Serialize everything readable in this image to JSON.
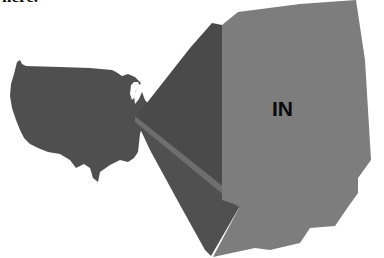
{
  "caption": {
    "text": "here."
  },
  "diagram": {
    "source_shape": "contiguous-usa-map",
    "target_shape": "indiana-outline",
    "target_label": "IN",
    "colors": {
      "background": "#ffffff",
      "usa_map": "#4f4f4f",
      "funnel_dark": "#4a4a4a",
      "funnel_strip": "#6e6e6e",
      "side_face": "#555555",
      "state_face": "#7d7d7d",
      "label": "#0a0a0a"
    }
  }
}
